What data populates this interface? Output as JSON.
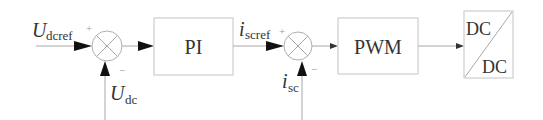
{
  "diagram": {
    "type": "control-block-diagram",
    "inputs": {
      "voltage_ref": {
        "main": "U",
        "sub": "dcref"
      },
      "voltage_fb": {
        "main": "U",
        "sub": "dc"
      },
      "current_ref": {
        "main": "i",
        "sub": "scref"
      },
      "current_fb": {
        "main": "i",
        "sub": "sc"
      }
    },
    "summing_junctions": [
      {
        "id": "sum1",
        "plus_sign": "+",
        "minus_sign": "−"
      },
      {
        "id": "sum2",
        "plus_sign": "+",
        "minus_sign": "−"
      }
    ],
    "blocks": {
      "pi": "PI",
      "pwm": "PWM",
      "converter_top": "DC",
      "converter_bottom": "DC"
    },
    "colors": {
      "line": "#a8a8a8",
      "box_border": "#c4c4c4",
      "arrowhead": "#111111",
      "text": "#333333"
    }
  }
}
